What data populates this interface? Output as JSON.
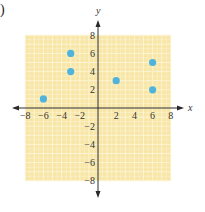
{
  "part_label": ")",
  "chart_data": {
    "type": "scatter",
    "title": "",
    "xlabel": "x",
    "ylabel": "y",
    "xlim": [
      -8,
      8
    ],
    "ylim": [
      -8,
      8
    ],
    "grid": true,
    "legend": null,
    "x_ticks": [
      -8,
      -6,
      -4,
      -2,
      2,
      4,
      6,
      8
    ],
    "y_ticks": [
      8,
      6,
      4,
      2,
      -2,
      -4,
      -6,
      -8
    ],
    "x_tick_labels": [
      "−8",
      "−6",
      "−4",
      "−2",
      "2",
      "4",
      "6",
      "8"
    ],
    "y_tick_labels": [
      "8",
      "6",
      "4",
      "2",
      "−2",
      "−4",
      "−6",
      "−8"
    ],
    "points": [
      {
        "x": -6,
        "y": 1
      },
      {
        "x": -3,
        "y": 6
      },
      {
        "x": -3,
        "y": 4
      },
      {
        "x": 2,
        "y": 3
      },
      {
        "x": 6,
        "y": 5
      },
      {
        "x": 6,
        "y": 2
      }
    ],
    "colors": {
      "grid_fill": "#f8e6a6",
      "grid_line": "#fdf5d8",
      "axis": "#2a2a2a",
      "point": "#4fb3dc"
    }
  }
}
